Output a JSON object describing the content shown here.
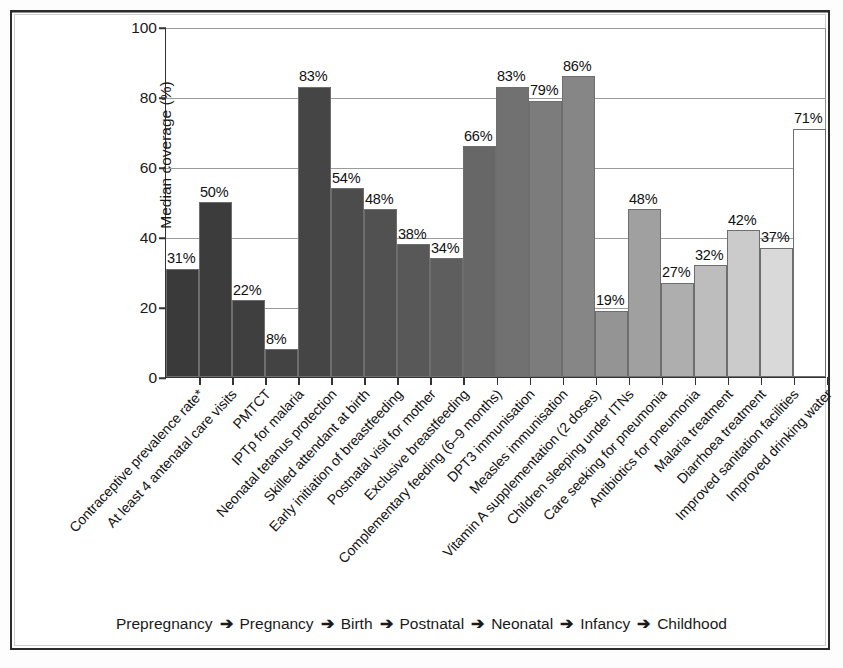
{
  "chart_data": {
    "type": "bar",
    "title": "",
    "xlabel": "",
    "ylabel": "Median coverage (%)",
    "ylim": [
      0,
      100
    ],
    "yticks": [
      0,
      20,
      40,
      60,
      80,
      100
    ],
    "ytick_labels": [
      "0",
      "20",
      "40",
      "60",
      "80",
      "100"
    ],
    "grid": true,
    "legend_position": "none",
    "categories": [
      "Contraceptive prevalence rate*",
      "At least 4 antenatal care visits",
      "PMTCT",
      "IPTp for malaria",
      "Neonatal tetanus protection",
      "Skilled attendant at birth",
      "Early initiation of breastfeeding",
      "Postnatal visit for mother",
      "Exclusive breastfeeding",
      "Complementary feeding (6–9 months)",
      "DPT3 immunisation",
      "Measles immunisation",
      "Vitamin A supplementation (2 doses)",
      "Children sleeping under ITNs",
      "Care seeking for pneumonia",
      "Antibiotics for pneumonia",
      "Malaria treatment",
      "Diarrhoea treatment",
      "Improved sanitation facilities",
      "Improved drinking water"
    ],
    "values": [
      31,
      50,
      22,
      8,
      83,
      54,
      48,
      38,
      34,
      66,
      83,
      79,
      86,
      19,
      48,
      27,
      32,
      42,
      37,
      71
    ],
    "value_labels": [
      "31%",
      "50%",
      "22%",
      "8%",
      "83%",
      "54%",
      "48%",
      "38%",
      "34%",
      "66%",
      "83%",
      "79%",
      "86%",
      "19%",
      "48%",
      "27%",
      "32%",
      "42%",
      "37%",
      "71%"
    ],
    "bar_colors": [
      "#3a3a3a",
      "#3c3c3c",
      "#3f3f3f",
      "#434343",
      "#454545",
      "#4c4c4c",
      "#515151",
      "#585858",
      "#5e5e5e",
      "#676767",
      "#717171",
      "#7c7c7c",
      "#868686",
      "#949494",
      "#a0a0a0",
      "#aeaeae",
      "#bdbdbd",
      "#cbcbcb",
      "#d9d9d9",
      "#ffffff"
    ]
  },
  "axis": {
    "y_title": "Median coverage (%)"
  },
  "lifestage": {
    "stages": [
      "Prepregnancy",
      "Pregnancy",
      "Birth",
      "Postnatal",
      "Neonatal",
      "Infancy",
      "Childhood"
    ],
    "arrow": "➔"
  }
}
